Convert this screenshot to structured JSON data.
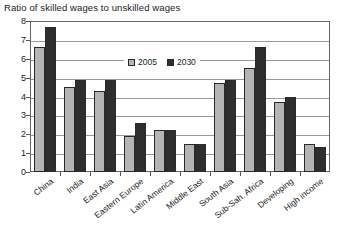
{
  "chart_data": {
    "type": "bar",
    "title": "Ratio of skilled wages to unskilled wages",
    "xlabel": "",
    "ylabel": "",
    "ylim": [
      0,
      8
    ],
    "yticks": [
      0,
      1,
      2,
      3,
      4,
      5,
      6,
      7,
      8
    ],
    "grid": true,
    "legend_position": "inside-top-center",
    "categories": [
      "China",
      "India",
      "East Asia",
      "Eastern Europe",
      "Latin America",
      "Middle East",
      "South Asia",
      "Sub-Sah. Africa",
      "Developing",
      "High income"
    ],
    "series": [
      {
        "name": "2005",
        "color": "#b4b4b4",
        "values": [
          6.6,
          4.5,
          4.3,
          1.9,
          2.2,
          1.5,
          4.7,
          5.5,
          3.7,
          1.5
        ]
      },
      {
        "name": "2030",
        "color": "#2e2e2e",
        "values": [
          7.7,
          4.9,
          4.9,
          2.6,
          2.2,
          1.5,
          4.9,
          6.6,
          4.0,
          1.3
        ]
      }
    ]
  }
}
